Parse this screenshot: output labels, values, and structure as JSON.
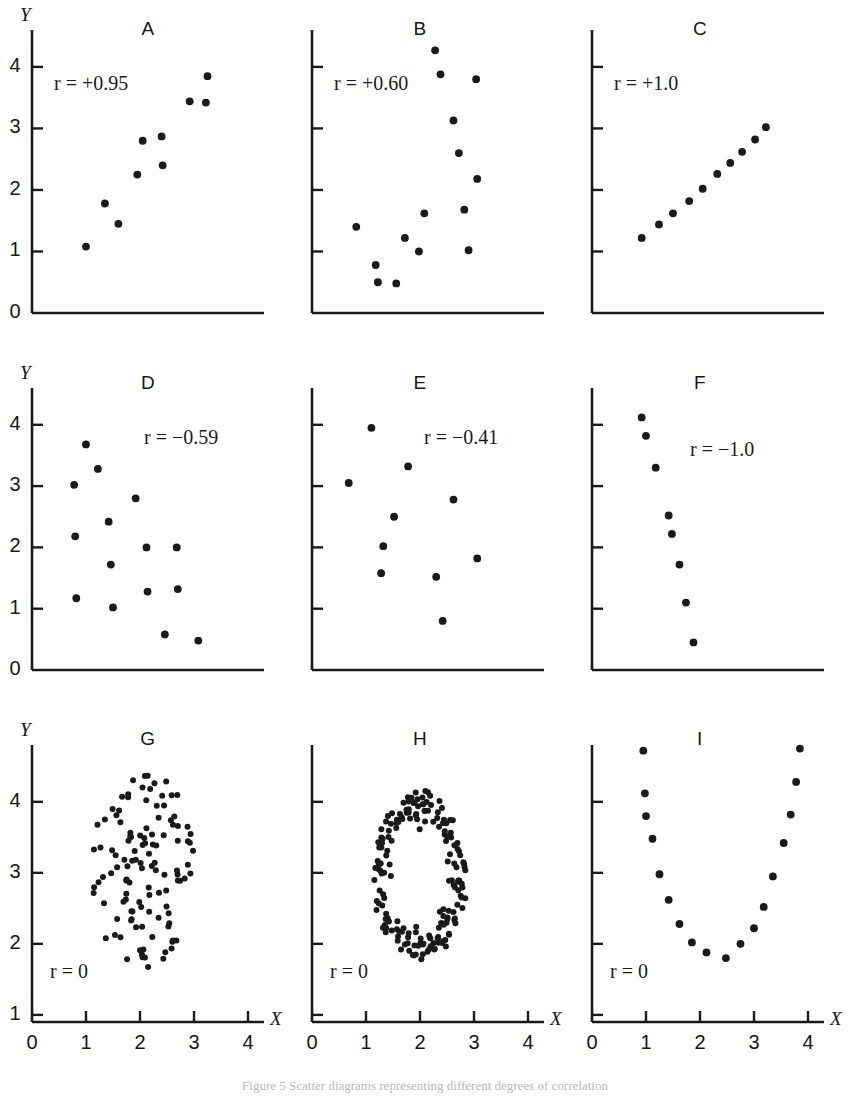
{
  "figure": {
    "caption": "Figure 5   Scatter diagrams representing different degrees of correlation",
    "axis_x_letter": "X",
    "axis_y_letter": "Y",
    "x_ticks": [
      "0",
      "1",
      "2",
      "3",
      "4"
    ],
    "y_ticks_top": [
      "0",
      "1",
      "2",
      "3",
      "4"
    ],
    "y_ticks_bottom": [
      "1",
      "2",
      "3",
      "4"
    ],
    "ink_color": "#1a1a1a"
  },
  "chart_data": [
    {
      "type": "scatter",
      "title": "A",
      "annotation": "r = +0.95",
      "r": 0.95,
      "xlabel": "X",
      "ylabel": "Y",
      "xlim": [
        0,
        4
      ],
      "ylim": [
        0,
        4.6
      ],
      "grid": false,
      "points": [
        [
          1.0,
          1.08
        ],
        [
          1.35,
          1.78
        ],
        [
          1.6,
          1.45
        ],
        [
          1.95,
          2.25
        ],
        [
          2.05,
          2.8
        ],
        [
          2.4,
          2.87
        ],
        [
          2.42,
          2.4
        ],
        [
          2.92,
          3.44
        ],
        [
          3.22,
          3.42
        ],
        [
          3.25,
          3.85
        ]
      ]
    },
    {
      "type": "scatter",
      "title": "B",
      "annotation": "r = +0.60",
      "r": 0.6,
      "xlabel": "X",
      "ylabel": "Y",
      "xlim": [
        0,
        4
      ],
      "ylim": [
        0,
        4.6
      ],
      "grid": false,
      "points": [
        [
          0.82,
          1.4
        ],
        [
          1.18,
          0.78
        ],
        [
          1.22,
          0.5
        ],
        [
          1.56,
          0.48
        ],
        [
          1.72,
          1.22
        ],
        [
          1.98,
          1.0
        ],
        [
          2.08,
          1.62
        ],
        [
          2.28,
          4.27
        ],
        [
          2.38,
          3.88
        ],
        [
          2.62,
          3.13
        ],
        [
          2.72,
          2.6
        ],
        [
          2.82,
          1.68
        ],
        [
          2.9,
          1.02
        ],
        [
          3.04,
          3.8
        ],
        [
          3.06,
          2.18
        ]
      ]
    },
    {
      "type": "scatter",
      "title": "C",
      "annotation": "r = +1.0",
      "r": 1.0,
      "xlabel": "X",
      "ylabel": "Y",
      "xlim": [
        0,
        4
      ],
      "ylim": [
        0,
        4.6
      ],
      "grid": false,
      "points": [
        [
          0.92,
          1.22
        ],
        [
          1.24,
          1.44
        ],
        [
          1.5,
          1.62
        ],
        [
          1.8,
          1.82
        ],
        [
          2.05,
          2.02
        ],
        [
          2.32,
          2.26
        ],
        [
          2.56,
          2.44
        ],
        [
          2.78,
          2.62
        ],
        [
          3.02,
          2.82
        ],
        [
          3.22,
          3.02
        ]
      ]
    },
    {
      "type": "scatter",
      "title": "D",
      "annotation": "r = −0.59",
      "r": -0.59,
      "xlabel": "X",
      "ylabel": "Y",
      "xlim": [
        0,
        4
      ],
      "ylim": [
        0,
        4.6
      ],
      "grid": false,
      "points": [
        [
          0.78,
          3.02
        ],
        [
          0.8,
          2.18
        ],
        [
          0.82,
          1.17
        ],
        [
          1.0,
          3.68
        ],
        [
          1.22,
          3.28
        ],
        [
          1.42,
          2.42
        ],
        [
          1.46,
          1.72
        ],
        [
          1.5,
          1.02
        ],
        [
          1.92,
          2.8
        ],
        [
          2.12,
          2.0
        ],
        [
          2.14,
          1.28
        ],
        [
          2.46,
          0.58
        ],
        [
          2.68,
          2.0
        ],
        [
          2.7,
          1.32
        ],
        [
          3.08,
          0.48
        ]
      ]
    },
    {
      "type": "scatter",
      "title": "E",
      "annotation": "r = −0.41",
      "r": -0.41,
      "xlabel": "X",
      "ylabel": "Y",
      "xlim": [
        0,
        4
      ],
      "ylim": [
        0,
        4.6
      ],
      "grid": false,
      "points": [
        [
          0.68,
          3.05
        ],
        [
          1.1,
          3.95
        ],
        [
          1.28,
          1.58
        ],
        [
          1.32,
          2.02
        ],
        [
          1.52,
          2.5
        ],
        [
          1.78,
          3.32
        ],
        [
          2.3,
          1.52
        ],
        [
          2.42,
          0.8
        ],
        [
          2.62,
          2.78
        ],
        [
          3.06,
          1.82
        ]
      ]
    },
    {
      "type": "scatter",
      "title": "F",
      "annotation": "r = −1.0",
      "r": -1.0,
      "xlabel": "X",
      "ylabel": "Y",
      "xlim": [
        0,
        4
      ],
      "ylim": [
        0,
        4.6
      ],
      "grid": false,
      "points": [
        [
          0.92,
          4.12
        ],
        [
          1.0,
          3.82
        ],
        [
          1.18,
          3.3
        ],
        [
          1.42,
          2.52
        ],
        [
          1.48,
          2.22
        ],
        [
          1.62,
          1.72
        ],
        [
          1.74,
          1.1
        ],
        [
          1.88,
          0.45
        ]
      ]
    },
    {
      "type": "scatter",
      "title": "G",
      "annotation": "r = 0",
      "r": 0,
      "xlabel": "X",
      "ylabel": "Y",
      "xlim": [
        0,
        4
      ],
      "ylim": [
        0.9,
        4.8
      ],
      "grid": false,
      "shape": "blob-cluster",
      "n_points": 118,
      "seed": 17,
      "center": [
        2.05,
        3.05
      ],
      "radius_x": 0.95,
      "radius_y": 1.45
    },
    {
      "type": "scatter",
      "title": "H",
      "annotation": "r = 0",
      "r": 0,
      "xlabel": "X",
      "ylabel": "Y",
      "xlim": [
        0,
        4
      ],
      "ylim": [
        0.9,
        4.8
      ],
      "grid": false,
      "shape": "ring",
      "n_points": 185,
      "seed": 41,
      "center": [
        2.0,
        2.95
      ],
      "radius_x": 0.86,
      "radius_y": 1.18,
      "ring_thickness": 0.33
    },
    {
      "type": "scatter",
      "title": "I",
      "annotation": "r = 0",
      "r": 0,
      "xlabel": "X",
      "ylabel": "Y",
      "xlim": [
        0,
        4
      ],
      "ylim": [
        0.9,
        4.8
      ],
      "grid": false,
      "shape": "parabola",
      "points": [
        [
          0.95,
          4.72
        ],
        [
          0.98,
          4.12
        ],
        [
          1.0,
          3.8
        ],
        [
          1.12,
          3.48
        ],
        [
          1.25,
          2.98
        ],
        [
          1.42,
          2.62
        ],
        [
          1.62,
          2.28
        ],
        [
          1.85,
          2.02
        ],
        [
          2.12,
          1.88
        ],
        [
          2.48,
          1.8
        ],
        [
          2.75,
          2.0
        ],
        [
          3.0,
          2.22
        ],
        [
          3.18,
          2.52
        ],
        [
          3.35,
          2.95
        ],
        [
          3.55,
          3.42
        ],
        [
          3.68,
          3.82
        ],
        [
          3.78,
          4.28
        ],
        [
          3.85,
          4.75
        ]
      ]
    }
  ]
}
